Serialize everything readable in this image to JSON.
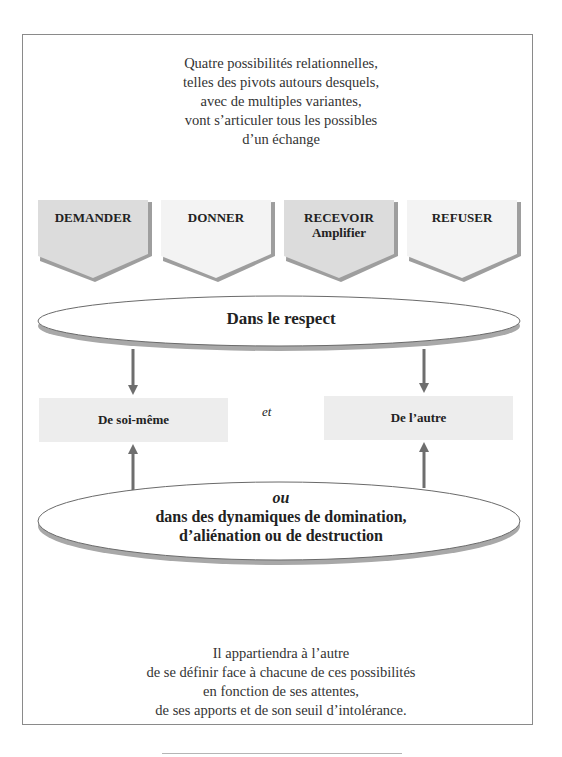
{
  "intro": {
    "lines": [
      "Quatre possibilités relationnelles,",
      "telles des pivots autours desquels,",
      "avec de multiples variantes,",
      "vont s’articuler tous les possibles",
      "d’un échange"
    ]
  },
  "chevrons": [
    {
      "label": "DEMANDER",
      "sublabel": "",
      "fill": "#dcdcdc"
    },
    {
      "label": "DONNER",
      "sublabel": "",
      "fill": "#f3f3f3"
    },
    {
      "label": "RECEVOIR",
      "sublabel": "Amplifier",
      "fill": "#dcdcdc"
    },
    {
      "label": "REFUSER",
      "sublabel": "",
      "fill": "#f3f3f3"
    }
  ],
  "top_ellipse": {
    "text": "Dans le respect"
  },
  "boxes": {
    "left": "De soi-même",
    "connector": "et",
    "right": "De l’autre"
  },
  "bottom_ellipse": {
    "prefix": "ou",
    "line1": "dans des dynamiques de domination,",
    "line2": "d’aliénation ou de destruction"
  },
  "outro": {
    "lines": [
      "Il appartiendra à l’autre",
      "de se définir face à chacune de ces possibilités",
      "en fonction de ses attentes,",
      "de ses apports et de son seuil d’intolérance."
    ]
  },
  "colors": {
    "frame": "#8a8a8a",
    "shadow": "#a8a8a8",
    "arrow": "#6e6e6e",
    "box": "#ededed"
  }
}
